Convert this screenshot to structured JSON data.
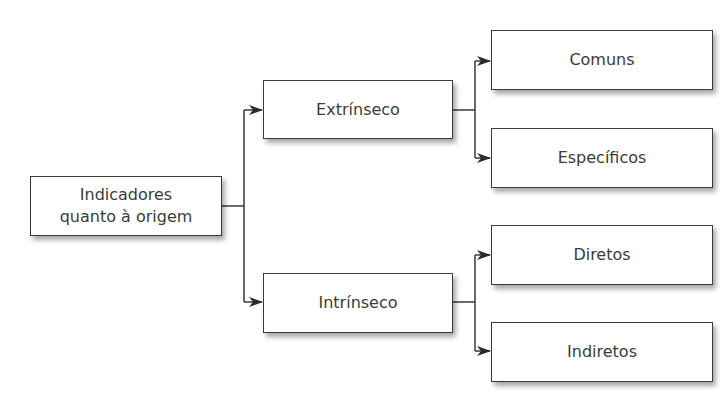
{
  "diagram": {
    "type": "tree",
    "root": {
      "id": "root",
      "label_line1": "Indicadores",
      "label_line2": "quanto à origem"
    },
    "level1": [
      {
        "id": "extrinseco",
        "label": "Extrínseco"
      },
      {
        "id": "intrinseco",
        "label": "Intrínseco"
      }
    ],
    "level2": [
      {
        "id": "comuns",
        "label": "Comuns",
        "parent": "extrinseco"
      },
      {
        "id": "especificos",
        "label": "Específicos",
        "parent": "extrinseco"
      },
      {
        "id": "diretos",
        "label": "Diretos",
        "parent": "intrinseco"
      },
      {
        "id": "indiretos",
        "label": "Indiretos",
        "parent": "intrinseco"
      }
    ],
    "edges": [
      [
        "root",
        "extrinseco"
      ],
      [
        "root",
        "intrinseco"
      ],
      [
        "extrinseco",
        "comuns"
      ],
      [
        "extrinseco",
        "especificos"
      ],
      [
        "intrinseco",
        "diretos"
      ],
      [
        "intrinseco",
        "indiretos"
      ]
    ],
    "colors": {
      "stroke": "#3a3a3a",
      "text": "#3b3b3b",
      "background": "#ffffff"
    }
  }
}
